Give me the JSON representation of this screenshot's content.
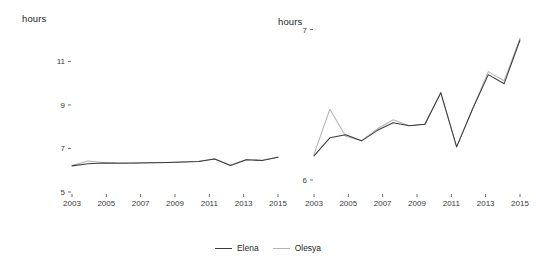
{
  "legend": {
    "items": [
      {
        "label": "Elena",
        "color": "#3b3b3b"
      },
      {
        "label": "Olesya",
        "color": "#b4b4b4"
      }
    ]
  },
  "watermark": {
    "line1": "",
    "line2": "",
    "line3": "",
    "line4": ""
  },
  "chart_data": [
    {
      "id": "left",
      "type": "line",
      "title": "",
      "xlabel": "",
      "ylabel": "hours",
      "x": [
        2003,
        2004,
        2005,
        2006,
        2007,
        2008,
        2009,
        2010,
        2011,
        2012,
        2013,
        2014,
        2015
      ],
      "xticks": [
        2003,
        2005,
        2007,
        2009,
        2011,
        2013,
        2015
      ],
      "yticks": [
        5,
        7,
        9,
        11
      ],
      "xlim": [
        2003,
        2015
      ],
      "ylim": [
        5,
        11.8
      ],
      "grid": false,
      "legend_position": "bottom-center",
      "series": [
        {
          "name": "Elena",
          "color": "#3b3b3b",
          "values": [
            6.2,
            6.3,
            6.33,
            6.32,
            6.33,
            6.34,
            6.36,
            6.38,
            6.4,
            6.52,
            6.22,
            6.48,
            6.45,
            6.6
          ]
        },
        {
          "name": "Olesya",
          "color": "#b4b4b4",
          "values": [
            6.22,
            6.42,
            6.36,
            6.33,
            6.33,
            6.34,
            6.36,
            6.38,
            6.41,
            6.53,
            6.23,
            6.49,
            6.46,
            6.61
          ]
        }
      ]
    },
    {
      "id": "right",
      "type": "line",
      "title": "",
      "xlabel": "",
      "ylabel": "hours",
      "x": [
        2003,
        2004,
        2005,
        2006,
        2007,
        2008,
        2009,
        2010,
        2011,
        2012,
        2013,
        2014,
        2015
      ],
      "xticks": [
        2003,
        2005,
        2007,
        2009,
        2011,
        2013,
        2015
      ],
      "yticks": [
        7,
        6
      ],
      "xlim": [
        2003,
        2015
      ],
      "ylim": [
        5.92,
        7.05
      ],
      "grid": false,
      "legend_position": "bottom-center",
      "series": [
        {
          "name": "Elena",
          "color": "#3b3b3b",
          "values": [
            6.16,
            6.28,
            6.3,
            6.26,
            6.33,
            6.38,
            6.36,
            6.37,
            6.58,
            6.22,
            6.47,
            6.7,
            6.64,
            6.93
          ]
        },
        {
          "name": "Olesya",
          "color": "#b4b4b4",
          "values": [
            6.17,
            6.47,
            6.29,
            6.26,
            6.34,
            6.4,
            6.36,
            6.37,
            6.58,
            6.22,
            6.47,
            6.72,
            6.66,
            6.94
          ]
        }
      ]
    }
  ]
}
